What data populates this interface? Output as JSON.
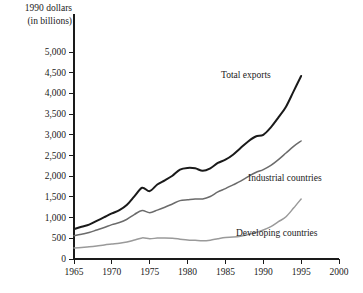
{
  "chart_data": {
    "type": "line",
    "title": "",
    "subtitle": "",
    "ylabel_line1": "1990 dollars",
    "ylabel_line2": "(in billions)",
    "xlabel": "",
    "grid": false,
    "legend_position": "inline-annotations",
    "xlim": [
      1965,
      2000
    ],
    "ylim": [
      0,
      5000
    ],
    "xticks": [
      1965,
      1970,
      1975,
      1980,
      1985,
      1990,
      1995,
      2000
    ],
    "xtick_labels": [
      "1965",
      "1970",
      "1975",
      "1980",
      "1985",
      "1990",
      "1995",
      "2000"
    ],
    "yticks": [
      0,
      500,
      1000,
      1500,
      2000,
      2500,
      3000,
      3500,
      4000,
      4500,
      5000
    ],
    "ytick_labels": [
      "0",
      "500",
      "1,000",
      "1,500",
      "2,000",
      "2,500",
      "3,000",
      "3,500",
      "4,000",
      "4,500",
      "5,000"
    ],
    "x": [
      1965,
      1966,
      1967,
      1968,
      1969,
      1970,
      1971,
      1972,
      1973,
      1974,
      1975,
      1976,
      1977,
      1978,
      1979,
      1980,
      1981,
      1982,
      1983,
      1984,
      1985,
      1986,
      1987,
      1988,
      1989,
      1990,
      1991,
      1992,
      1993,
      1994,
      1995
    ],
    "series": [
      {
        "name": "Total exports",
        "color": "#1a1a1a",
        "width": 2.0,
        "label_x": 1988,
        "label_y": 4450,
        "values": [
          720,
          780,
          830,
          920,
          1010,
          1100,
          1180,
          1310,
          1520,
          1720,
          1640,
          1800,
          1900,
          2010,
          2160,
          2200,
          2190,
          2130,
          2190,
          2320,
          2400,
          2520,
          2680,
          2840,
          2960,
          3000,
          3180,
          3420,
          3680,
          4050,
          4420
        ]
      },
      {
        "name": "Industrial countries",
        "color": "#6b6b6b",
        "width": 1.5,
        "label_x": 1990,
        "label_y": 2150,
        "values": [
          560,
          600,
          640,
          700,
          760,
          830,
          880,
          960,
          1080,
          1170,
          1120,
          1180,
          1250,
          1330,
          1410,
          1430,
          1450,
          1450,
          1510,
          1620,
          1700,
          1790,
          1880,
          1990,
          2090,
          2160,
          2260,
          2400,
          2560,
          2720,
          2850
        ]
      },
      {
        "name": "Developing countries",
        "color": "#9a9a9a",
        "width": 1.5,
        "label_x": 1987,
        "label_y": 760,
        "values": [
          265,
          280,
          295,
          315,
          340,
          360,
          380,
          410,
          460,
          510,
          490,
          505,
          510,
          500,
          480,
          460,
          450,
          440,
          455,
          490,
          520,
          530,
          550,
          590,
          640,
          700,
          780,
          900,
          1020,
          1230,
          1450
        ]
      }
    ]
  },
  "annotations": [
    {
      "text": "Total exports"
    },
    {
      "text": "Industrial countries"
    },
    {
      "text": "Developing countries"
    }
  ]
}
